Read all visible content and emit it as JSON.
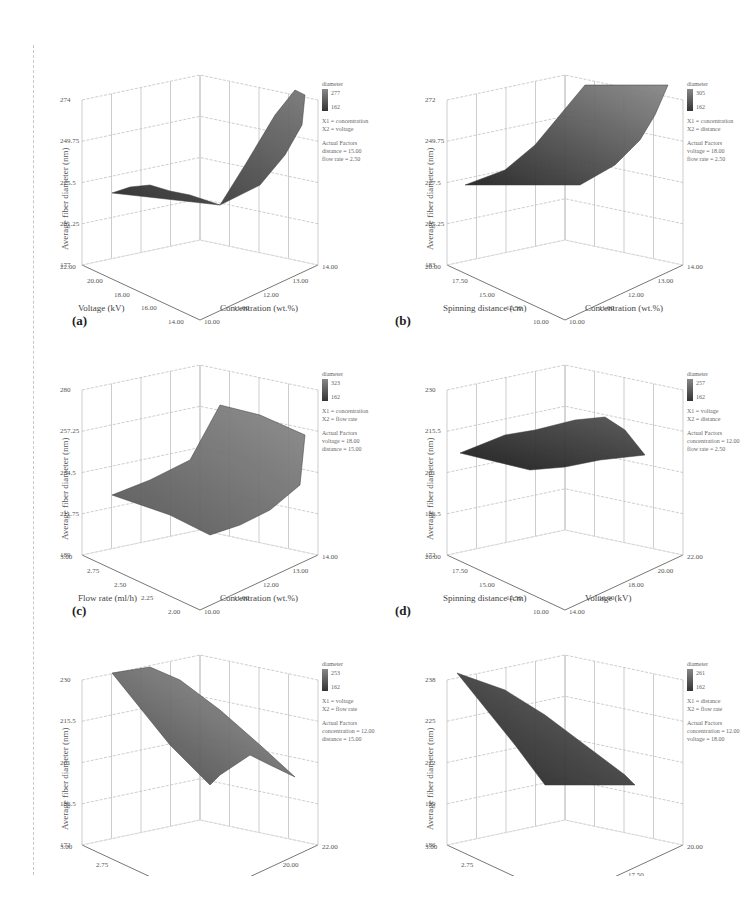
{
  "figure": {
    "ylabel": "Average fiber diameter (nm)",
    "colorbar_title": "diameter",
    "actual_factors_title": "Actual Factors"
  },
  "panels": [
    {
      "label": "(a)",
      "z_ticks": [
        "274",
        "249.75",
        "225.5",
        "201.25",
        "177"
      ],
      "left_axis_title": "Voltage (kV)",
      "left_ticks": [
        "22.00",
        "20.00",
        "18.00",
        "16.00",
        "14.00"
      ],
      "right_axis_title": "Concentration (wt.%)",
      "right_ticks": [
        "10.00",
        "11.00",
        "12.00",
        "13.00",
        "14.00"
      ],
      "colorbar_max": "277",
      "colorbar_min": "162",
      "x1": "X1 = concentration",
      "x2": "X2 = voltage",
      "factor1": "distance = 15.00",
      "factor2": "flow rate = 2.50"
    },
    {
      "label": "(b)",
      "z_ticks": [
        "272",
        "249.75",
        "227.5",
        "205.25",
        "183"
      ],
      "left_axis_title": "Spinning distance (cm)",
      "left_ticks": [
        "20.00",
        "17.50",
        "15.00",
        "12.50",
        "10.00"
      ],
      "right_axis_title": "Concentration (wt.%)",
      "right_ticks": [
        "10.00",
        "11.00",
        "12.00",
        "13.00",
        "14.00"
      ],
      "colorbar_max": "305",
      "colorbar_min": "162",
      "x1": "X1 = concentration",
      "x2": "X2 = distance",
      "factor1": "voltage = 18.00",
      "factor2": "flow rate = 2.50"
    },
    {
      "label": "(c)",
      "z_ticks": [
        "280",
        "257.25",
        "234.5",
        "211.75",
        "189"
      ],
      "left_axis_title": "Flow rate (ml/h)",
      "left_ticks": [
        "3.00",
        "2.75",
        "2.50",
        "2.25",
        "2.00"
      ],
      "right_axis_title": "Concentration (wt.%)",
      "right_ticks": [
        "10.00",
        "11.00",
        "12.00",
        "13.00",
        "14.00"
      ],
      "colorbar_max": "323",
      "colorbar_min": "162",
      "x1": "X1 = concentration",
      "x2": "X2 = flow rate",
      "factor1": "voltage = 18.00",
      "factor2": "distance = 15.00"
    },
    {
      "label": "(d)",
      "z_ticks": [
        "230",
        "215.5",
        "201",
        "186.5",
        "172"
      ],
      "left_axis_title": "Spinning distance (cm)",
      "left_ticks": [
        "20.00",
        "17.50",
        "15.00",
        "12.50",
        "10.00"
      ],
      "right_axis_title": "Voltage (kV)",
      "right_ticks": [
        "14.00",
        "16.00",
        "18.00",
        "20.00",
        "22.00"
      ],
      "colorbar_max": "257",
      "colorbar_min": "162",
      "x1": "X1 = voltage",
      "x2": "X2 = distance",
      "factor1": "concentration = 12.00",
      "factor2": "flow rate = 2.50"
    },
    {
      "label": "(e)",
      "z_ticks": [
        "230",
        "215.5",
        "201",
        "186.5",
        "172"
      ],
      "left_axis_title": "Flow rate (ml/h)",
      "left_ticks": [
        "3.00",
        "2.75",
        "2.50",
        "2.25"
      ],
      "right_axis_title": "Voltage (kV)",
      "right_ticks": [
        "14.00",
        "18.00",
        "20.00",
        "22.00"
      ],
      "colorbar_max": "253",
      "colorbar_min": "162",
      "x1": "X1 = voltage",
      "x2": "X2 = flow rate",
      "factor1": "concentration = 12.00",
      "factor2": "distance = 15.00"
    },
    {
      "label": "(f)",
      "z_ticks": [
        "238",
        "225",
        "212",
        "199",
        "186"
      ],
      "left_axis_title": "Flow rate (ml/h)",
      "left_ticks": [
        "3.00",
        "2.75",
        "2.50",
        "2.25"
      ],
      "right_axis_title": "Spinning distance (cm)",
      "right_ticks": [
        "15.00",
        "17.50",
        "20.00"
      ],
      "colorbar_max": "261",
      "colorbar_min": "162",
      "x1": "X1 = distance",
      "x2": "X2 = flow rate",
      "factor1": "concentration = 12.00",
      "factor2": "voltage = 18.00"
    }
  ],
  "chart_data": [
    {
      "type": "surface",
      "title": "(a)",
      "xlabel": "Concentration (wt.%)",
      "ylabel": "Voltage (kV)",
      "zlabel": "Average fiber diameter (nm)",
      "x": [
        10,
        11,
        12,
        13,
        14
      ],
      "y": [
        14,
        16,
        18,
        20,
        22
      ],
      "zlim": [
        177,
        274
      ],
      "description": "Diameter rises strongly with concentration (S-shaped); peak ~274 at 14 wt.% and mid voltage, minimum ~177 at low concentration.",
      "fixed": {
        "distance": 15.0,
        "flow_rate": 2.5
      }
    },
    {
      "type": "surface",
      "title": "(b)",
      "xlabel": "Concentration (wt.%)",
      "ylabel": "Spinning distance (cm)",
      "zlabel": "Average fiber diameter (nm)",
      "x": [
        10,
        11,
        12,
        13,
        14
      ],
      "y": [
        10,
        12.5,
        15,
        17.5,
        20
      ],
      "zlim": [
        183,
        272
      ],
      "description": "Diameter increases quadratically with concentration (~183 at 10 wt.% to ~272 at 14 wt.%); nearly flat along distance.",
      "fixed": {
        "voltage": 18.0,
        "flow_rate": 2.5
      }
    },
    {
      "type": "surface",
      "title": "(c)",
      "xlabel": "Concentration (wt.%)",
      "ylabel": "Flow rate (ml/h)",
      "zlabel": "Average fiber diameter (nm)",
      "x": [
        10,
        11,
        12,
        13,
        14
      ],
      "y": [
        2.0,
        2.25,
        2.5,
        2.75,
        3.0
      ],
      "zlim": [
        189,
        280
      ],
      "description": "Diameter increases with both concentration and flow rate; max ~280 at 14 wt.% and 3.00 ml/h.",
      "fixed": {
        "voltage": 18.0,
        "distance": 15.0
      }
    },
    {
      "type": "surface",
      "title": "(d)",
      "xlabel": "Voltage (kV)",
      "ylabel": "Spinning distance (cm)",
      "zlabel": "Average fiber diameter (nm)",
      "x": [
        14,
        16,
        18,
        20,
        22
      ],
      "y": [
        10,
        12.5,
        15,
        17.5,
        20
      ],
      "zlim": [
        172,
        230
      ],
      "description": "Dome-shaped surface around ~201-215 nm, peaking at mid voltage (~18-20 kV).",
      "fixed": {
        "concentration": 12.0,
        "flow_rate": 2.5
      }
    },
    {
      "type": "surface",
      "title": "(e)",
      "xlabel": "Voltage (kV)",
      "ylabel": "Flow rate (ml/h)",
      "zlabel": "Average fiber diameter (nm)",
      "x": [
        14,
        16,
        18,
        20,
        22
      ],
      "y": [
        2.0,
        2.25,
        2.5,
        2.75,
        3.0
      ],
      "zlim": [
        172,
        230
      ],
      "description": "Max ~230 at high flow rate / low voltage; decreases toward ~172 at high voltage.",
      "fixed": {
        "concentration": 12.0,
        "distance": 15.0
      }
    },
    {
      "type": "surface",
      "title": "(f)",
      "xlabel": "Spinning distance (cm)",
      "ylabel": "Flow rate (ml/h)",
      "zlabel": "Average fiber diameter (nm)",
      "x": [
        10,
        12.5,
        15,
        17.5,
        20
      ],
      "y": [
        2.0,
        2.25,
        2.5,
        2.75,
        3.0
      ],
      "zlim": [
        186,
        238
      ],
      "description": "Near-planar surface decreasing from ~238 (3.00 ml/h) to ~186 (high distance).",
      "fixed": {
        "concentration": 12.0,
        "voltage": 18.0
      }
    }
  ]
}
